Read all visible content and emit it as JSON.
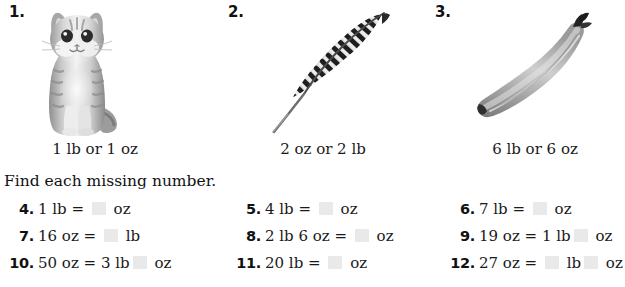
{
  "pictures": [
    {
      "number": "1.",
      "icon": "kitten-photo",
      "caption": "1 lb or 1 oz"
    },
    {
      "number": "2.",
      "icon": "feather-photo",
      "caption": "2 oz or 2 lb"
    },
    {
      "number": "3.",
      "icon": "banana-photo",
      "caption": "6 lb or 6 oz"
    }
  ],
  "instruction": "Find each missing number.",
  "exercises": [
    [
      {
        "number": "4.",
        "prefix": "1 lb = ",
        "mid": "",
        "suffix": " oz",
        "blanks": 1
      },
      {
        "number": "5.",
        "prefix": "4 lb = ",
        "mid": "",
        "suffix": " oz",
        "blanks": 1
      },
      {
        "number": "6.",
        "prefix": "7 lb = ",
        "mid": "",
        "suffix": " oz",
        "blanks": 1
      }
    ],
    [
      {
        "number": "7.",
        "prefix": "16 oz = ",
        "mid": "",
        "suffix": " lb",
        "blanks": 1
      },
      {
        "number": "8.",
        "prefix": "2 lb 6 oz = ",
        "mid": "",
        "suffix": " oz",
        "blanks": 1
      },
      {
        "number": "9.",
        "prefix": "19 oz = 1 lb",
        "mid": "",
        "suffix": " oz",
        "blanks": 1
      }
    ],
    [
      {
        "number": "10.",
        "prefix": "50 oz = 3 lb",
        "mid": "",
        "suffix": " oz",
        "blanks": 1
      },
      {
        "number": "11.",
        "prefix": "20 lb = ",
        "mid": "",
        "suffix": " oz",
        "blanks": 1
      },
      {
        "number": "12.",
        "prefix": "27 oz = ",
        "mid": " lb",
        "suffix": " oz",
        "blanks": 2
      }
    ]
  ],
  "colors": {
    "text": "#1a1a1a",
    "blank_fill": "#e9e9e9",
    "page_background": "#ffffff"
  }
}
